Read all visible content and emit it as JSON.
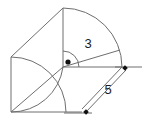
{
  "figure": {
    "type": "line-drawing",
    "background_color": "#ffffff",
    "stroke_color": "#6e6e6e",
    "text_color": "#1a1a1a",
    "labels": {
      "radius": "3",
      "side": "5"
    },
    "geometry": {
      "center_point": {
        "x": 63,
        "y": 67
      },
      "sector_radius_px": 59,
      "sector_start_angle_deg": 0,
      "sector_end_angle_deg": 90,
      "square_top_left": {
        "x": 11,
        "y": 57
      },
      "square_bottom_left": {
        "x": 11,
        "y": 112
      },
      "square_bottom_right": {
        "x": 82,
        "y": 112
      },
      "apex_top": {
        "x": 63,
        "y": 8
      },
      "arc_end_right": {
        "x": 120,
        "y": 50
      }
    },
    "annotations": {
      "angle_marker": "right-angle-arc",
      "center_dot": "center-point-dot",
      "dimension_line": "dimension-line-5",
      "radius_line": "radius-line-3"
    }
  }
}
